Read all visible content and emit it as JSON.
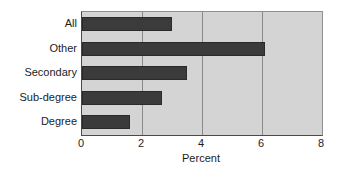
{
  "chart_data": {
    "type": "bar",
    "orientation": "horizontal",
    "title": "",
    "subtitle": "",
    "xlabel": "Percent",
    "ylabel": "",
    "categories": [
      "All",
      "Other",
      "Secondary",
      "Sub-degree",
      "Degree"
    ],
    "values": [
      3.0,
      6.1,
      3.5,
      2.65,
      1.6
    ],
    "series": [
      {
        "name": "Percent",
        "values": [
          3.0,
          6.1,
          3.5,
          2.65,
          1.6
        ]
      }
    ],
    "xlim": [
      0,
      8
    ],
    "xticks": [
      0,
      2,
      4,
      6,
      8
    ],
    "xtick_labels": [
      "0",
      "2",
      "4",
      "6",
      "8"
    ],
    "grid": true,
    "grid_axis": "x",
    "legend": false,
    "legend_position": "none",
    "annotations": [],
    "colors": {
      "bar_fill": "#3b3b3b",
      "bar_edge": "#2a2a2a",
      "plot_background": "#d4d4d4",
      "figure_background": "#ffffff",
      "gridline": "#8a8a8a",
      "axis_line": "#4a4a4a",
      "text": "#1c1c1c"
    }
  }
}
